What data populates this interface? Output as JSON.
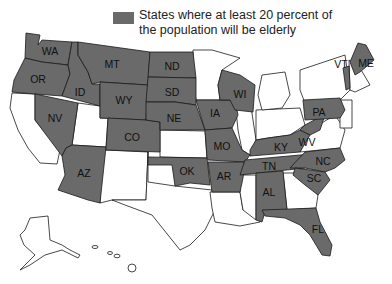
{
  "legend": {
    "line1": "States where at least 20 percent of",
    "line2": "the population will be elderly",
    "color": "#6a6a6a"
  },
  "highlighted_states": [
    "WA",
    "OR",
    "ID",
    "NV",
    "MT",
    "WY",
    "AZ",
    "CO",
    "ND",
    "SD",
    "NE",
    "OK",
    "IA",
    "WI",
    "MO",
    "AR",
    "KY",
    "WV",
    "TN",
    "AL",
    "NC",
    "SC",
    "FL",
    "PA",
    "VT",
    "ME"
  ],
  "labels": {
    "WA": "WA",
    "OR": "OR",
    "ID": "ID",
    "NV": "NV",
    "MT": "MT",
    "WY": "WY",
    "AZ": "AZ",
    "CO": "CO",
    "ND": "ND",
    "SD": "SD",
    "NE": "NE",
    "OK": "OK",
    "IA": "IA",
    "WI": "WI",
    "MO": "MO",
    "AR": "AR",
    "KY": "KY",
    "WV": "WV",
    "TN": "TN",
    "AL": "AL",
    "NC": "NC",
    "SC": "SC",
    "FL": "FL",
    "PA": "PA",
    "VT": "VT",
    "ME": "ME"
  }
}
